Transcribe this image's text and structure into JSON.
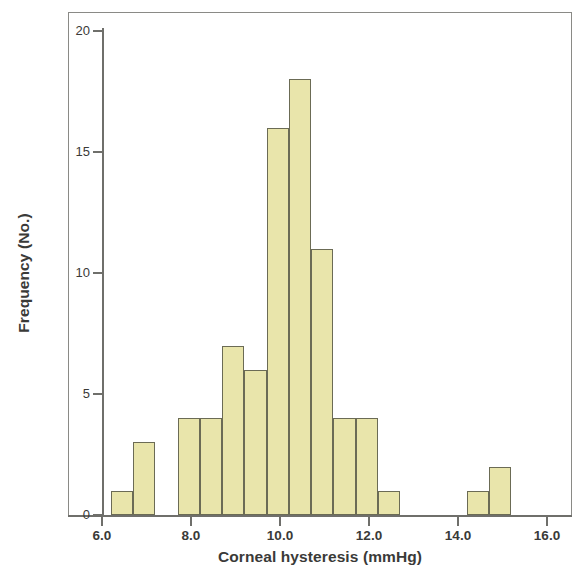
{
  "figure": {
    "kind": "histogram-figure",
    "background_color": "#ffffff",
    "frame_color": "#8a8a86",
    "axis_color": "#6f6f6b"
  },
  "axes": {
    "x_title": "Corneal hysteresis (mmHg)",
    "y_title": "Frequency (No.)",
    "x_tick_labels": [
      "6.0",
      "8.0",
      "10.0",
      "12.0",
      "14.0",
      "16.0"
    ],
    "x_tick_values": [
      6.0,
      8.0,
      10.0,
      12.0,
      14.0,
      16.0
    ],
    "y_tick_labels": [
      "0",
      "5",
      "10",
      "15",
      "20"
    ],
    "y_tick_values": [
      0,
      5,
      10,
      15,
      20
    ]
  },
  "chart_data": {
    "type": "bar",
    "title": "",
    "subtitle": "",
    "xlabel": "Corneal hysteresis (mmHg)",
    "ylabel": "Frequency (No.)",
    "xlim": [
      5.4,
      16.6
    ],
    "ylim": [
      0,
      21
    ],
    "grid": false,
    "legend": null,
    "bin_width": 0.5,
    "bar_fill_color": "#e9e5ab",
    "bar_edge_color": "#6b6b55",
    "bins": [
      {
        "left": 6.2,
        "right": 6.7,
        "center": 6.45,
        "value": 1
      },
      {
        "left": 6.7,
        "right": 7.2,
        "center": 6.95,
        "value": 3
      },
      {
        "left": 7.7,
        "right": 8.2,
        "center": 7.95,
        "value": 4
      },
      {
        "left": 8.2,
        "right": 8.7,
        "center": 8.45,
        "value": 4
      },
      {
        "left": 8.7,
        "right": 9.2,
        "center": 8.95,
        "value": 7
      },
      {
        "left": 9.2,
        "right": 9.7,
        "center": 9.45,
        "value": 6
      },
      {
        "left": 9.7,
        "right": 10.2,
        "center": 9.95,
        "value": 16
      },
      {
        "left": 10.2,
        "right": 10.7,
        "center": 10.45,
        "value": 18
      },
      {
        "left": 10.7,
        "right": 11.2,
        "center": 10.95,
        "value": 11
      },
      {
        "left": 11.2,
        "right": 11.7,
        "center": 11.45,
        "value": 4
      },
      {
        "left": 11.7,
        "right": 12.2,
        "center": 11.95,
        "value": 4
      },
      {
        "left": 12.2,
        "right": 12.7,
        "center": 12.45,
        "value": 1
      },
      {
        "left": 14.2,
        "right": 14.7,
        "center": 14.45,
        "value": 1
      },
      {
        "left": 14.7,
        "right": 15.2,
        "center": 14.95,
        "value": 2
      }
    ],
    "categories": [
      "6.45",
      "6.95",
      "7.95",
      "8.45",
      "8.95",
      "9.45",
      "9.95",
      "10.45",
      "10.95",
      "11.45",
      "11.95",
      "12.45",
      "14.45",
      "14.95"
    ],
    "values": [
      1,
      3,
      4,
      4,
      7,
      6,
      16,
      18,
      11,
      4,
      4,
      1,
      1,
      2
    ]
  }
}
